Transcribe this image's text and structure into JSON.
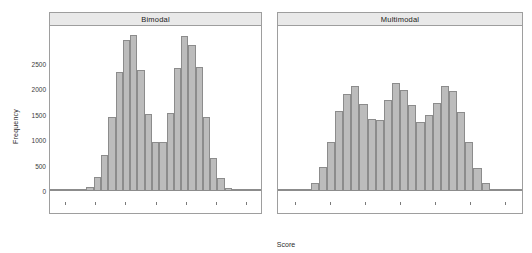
{
  "chart_data": {
    "type": "bar",
    "title": "",
    "xlabel": "Score",
    "ylabel": "Frequency",
    "ylim": [
      0,
      3000
    ],
    "grid": false,
    "legend": null,
    "y_ticks": [
      0,
      500,
      1000,
      1500,
      2000,
      2500
    ],
    "y_tick_labels": [
      "0",
      "500",
      "1000",
      "1500",
      "2000",
      "2500"
    ],
    "x_tick_labels": [],
    "x_tick_count": 7,
    "panels": [
      {
        "label": "Bimodal",
        "values": [
          0,
          0,
          0,
          0,
          10,
          75,
          270,
          670,
          1375,
          2210,
          2810,
          2900,
          2260,
          1440,
          910,
          910,
          1460,
          2300,
          2880,
          2730,
          2310,
          1380,
          615,
          235,
          55,
          10,
          0,
          0,
          0
        ]
      },
      {
        "label": "Multimodal",
        "values": [
          0,
          0,
          0,
          30,
          145,
          455,
          920,
          1500,
          1810,
          1965,
          1615,
          1345,
          1320,
          1690,
          2020,
          1875,
          1610,
          1295,
          1410,
          1640,
          1965,
          1855,
          1470,
          920,
          430,
          145,
          40,
          0,
          0,
          0
        ]
      }
    ],
    "bar_fill": "#bcbcbc",
    "bar_stroke": "#8c8c8c",
    "strip_fill": "#e9e9e9",
    "panel_border": "#9e9e9e"
  }
}
